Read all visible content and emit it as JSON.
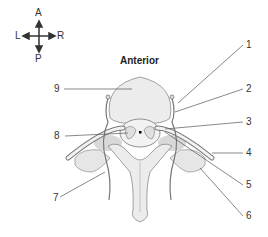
{
  "compass": {
    "top": "A",
    "bottom": "P",
    "left": "L",
    "right": "R"
  },
  "title": "Anterior",
  "labels": [
    {
      "id": "1",
      "text": "1"
    },
    {
      "id": "2",
      "text": "2"
    },
    {
      "id": "3",
      "text": "3"
    },
    {
      "id": "4",
      "text": "4"
    },
    {
      "id": "5",
      "text": "5"
    },
    {
      "id": "6",
      "text": "6"
    },
    {
      "id": "7",
      "text": "7"
    },
    {
      "id": "8",
      "text": "8"
    },
    {
      "id": "9",
      "text": "9"
    }
  ],
  "colors": {
    "bone": "#ececec",
    "bone_outline": "#8a8a8a",
    "muscle": "#d4d4d4",
    "line": "#555555"
  }
}
